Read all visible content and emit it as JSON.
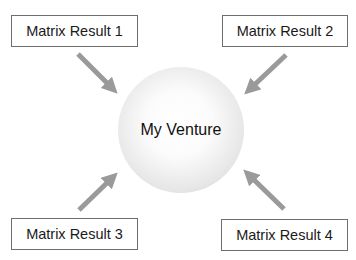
{
  "diagram": {
    "center": {
      "label": "My Venture"
    },
    "inputs": [
      {
        "label": "Matrix Result 1",
        "position": "top-left"
      },
      {
        "label": "Matrix Result 2",
        "position": "top-right"
      },
      {
        "label": "Matrix Result 3",
        "position": "bottom-left"
      },
      {
        "label": "Matrix Result 4",
        "position": "bottom-right"
      }
    ],
    "colors": {
      "arrow": "#9a9a9a",
      "box_border": "#6e6e6e",
      "text": "#1a1a1a"
    }
  }
}
